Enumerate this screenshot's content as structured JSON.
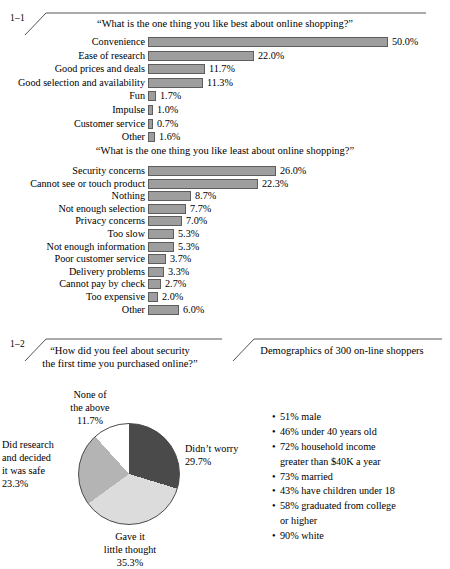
{
  "sections": {
    "s1": {
      "number": "1–1"
    },
    "s2": {
      "number": "1–2"
    }
  },
  "chart1": {
    "question": "“What is the one thing you like best about online shopping?”"
  },
  "chart2": {
    "question": "“What is the one thing you like least about online shopping?”"
  },
  "pie": {
    "question_line1": "“How did you feel about security",
    "question_line2": "the first time you purchased online?”",
    "labels": {
      "none_l1": "None of",
      "none_l2": "the above",
      "none_val": "11.7%",
      "didnt_l1": "Didn’t worry",
      "didnt_val": "29.7%",
      "research_l1": "Did research",
      "research_l2": "and decided",
      "research_l3": "it was safe",
      "research_val": "23.3%",
      "gave_l1": "Gave it",
      "gave_l2": "little thought",
      "gave_val": "35.3%"
    }
  },
  "demographics": {
    "title": "Demographics of 300 on-line shoppers",
    "items": [
      "51% male",
      "46% under 40 years old",
      "72% household income\ngreater than $40K a year",
      "73% married",
      "43% have children under 18",
      "58% graduated from college\nor higher",
      "90% white"
    ]
  },
  "colors": {
    "bar_fill": "#9e9e9e",
    "bar_border": "#5d5d5d",
    "pie_dark": "#4a4a4a",
    "pie_light": "#dcdcdc",
    "pie_medium": "#b4b4b4",
    "pie_white": "#ffffff",
    "rule": "#555555"
  },
  "chart_data": [
    {
      "type": "bar",
      "orientation": "horizontal",
      "title": "“What is the one thing you like best about online shopping?”",
      "xlabel": "",
      "ylabel": "",
      "grid": false,
      "legend": false,
      "value_suffix": "%",
      "xlim": [
        0,
        50
      ],
      "px_per_unit": 4.78,
      "min_bar_px": 5,
      "categories": [
        "Convenience",
        "Ease of research",
        "Good prices and deals",
        "Good selection and availability",
        "Fun",
        "Impulse",
        "Customer service",
        "Other"
      ],
      "values": [
        50.0,
        22.0,
        11.7,
        11.3,
        1.7,
        1.0,
        0.7,
        1.6
      ],
      "labels": [
        "50.0%",
        "22.0%",
        "11.7%",
        "11.3%",
        "1.7%",
        "1.0%",
        "0.7%",
        "1.6%"
      ],
      "bar_px": [
        240,
        106,
        57,
        55,
        8,
        5,
        5,
        7
      ]
    },
    {
      "type": "bar",
      "orientation": "horizontal",
      "title": "“What is the one thing you like least about online shopping?”",
      "xlabel": "",
      "ylabel": "",
      "grid": false,
      "legend": false,
      "value_suffix": "%",
      "xlim": [
        0,
        26
      ],
      "px_per_unit": 4.92,
      "min_bar_px": 10,
      "categories": [
        "Security concerns",
        "Cannot see or touch product",
        "Nothing",
        "Not enough selection",
        "Privacy concerns",
        "Too slow",
        "Not enough information",
        "Poor customer service",
        "Delivery problems",
        "Cannot pay by check",
        "Too expensive",
        "Other"
      ],
      "values": [
        26.0,
        22.3,
        8.7,
        7.7,
        7.0,
        5.3,
        5.3,
        3.7,
        3.3,
        2.7,
        2.0,
        6.0
      ],
      "labels": [
        "26.0%",
        "22.3%",
        "8.7%",
        "7.7%",
        "7.0%",
        "5.3%",
        "5.3%",
        "3.7%",
        "3.3%",
        "2.7%",
        "2.0%",
        "6.0%"
      ],
      "bar_px": [
        128,
        110,
        43,
        38,
        34,
        26,
        26,
        18,
        16,
        13,
        10,
        31
      ]
    },
    {
      "type": "pie",
      "title": "“How did you feel about security the first time you purchased online?”",
      "legend": false,
      "start_angle_deg": 0,
      "direction": "clockwise",
      "categories": [
        "Didn’t worry",
        "Gave it little thought",
        "Did research and decided it was safe",
        "None of the above"
      ],
      "values": [
        29.7,
        35.3,
        23.3,
        11.7
      ],
      "labels": [
        "29.7%",
        "35.3%",
        "23.3%",
        "11.7%"
      ],
      "slice_colors": [
        "#4a4a4a",
        "#dcdcdc",
        "#b4b4b4",
        "#ffffff"
      ]
    }
  ]
}
